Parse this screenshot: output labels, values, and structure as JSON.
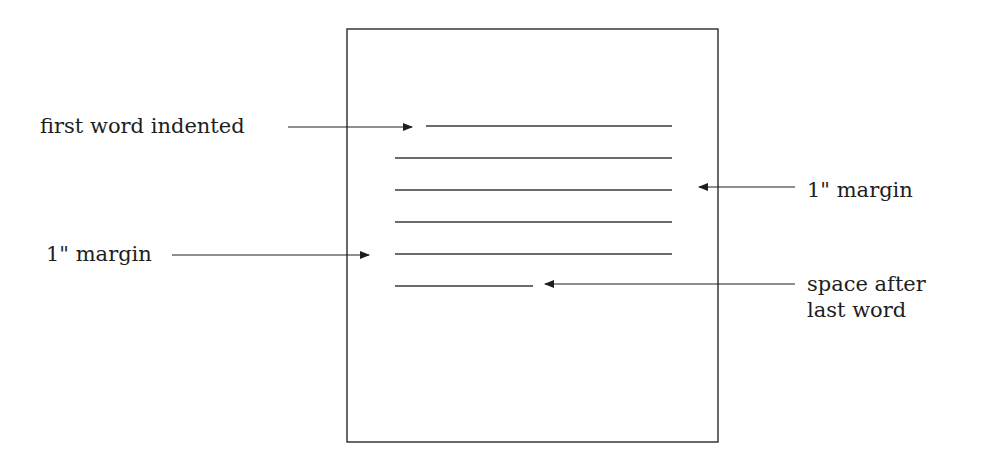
{
  "diagram": {
    "labels": {
      "first_word_indented": "first word indented",
      "left_margin": "1\" margin",
      "right_margin": "1\" margin",
      "space_after_line1": "space after",
      "space_after_line2": "last word"
    },
    "colors": {
      "ink": "#1e1e1e",
      "page_border": "#2a2a2a",
      "background": "#ffffff"
    },
    "page": {
      "x": 347,
      "y": 29,
      "width": 371,
      "height": 413
    },
    "text_lines": [
      {
        "x1": 426,
        "x2": 672,
        "y": 126,
        "role": "first-line-indented"
      },
      {
        "x1": 395,
        "x2": 672,
        "y": 158,
        "role": "body-line"
      },
      {
        "x1": 395,
        "x2": 672,
        "y": 190,
        "role": "body-line"
      },
      {
        "x1": 395,
        "x2": 672,
        "y": 222,
        "role": "body-line"
      },
      {
        "x1": 395,
        "x2": 672,
        "y": 254,
        "role": "body-line"
      },
      {
        "x1": 395,
        "x2": 533,
        "y": 286,
        "role": "last-line"
      }
    ],
    "arrows": [
      {
        "name": "first-word-indented-arrow",
        "x1": 288,
        "x2": 412,
        "y": 127,
        "direction": "right"
      },
      {
        "name": "left-margin-arrow",
        "x1": 172,
        "x2": 369,
        "y": 255,
        "direction": "right"
      },
      {
        "name": "right-margin-arrow",
        "x1": 795,
        "x2": 699,
        "y": 187,
        "direction": "left"
      },
      {
        "name": "space-after-last-word-arrow",
        "x1": 795,
        "x2": 545,
        "y": 284,
        "direction": "left"
      }
    ]
  }
}
